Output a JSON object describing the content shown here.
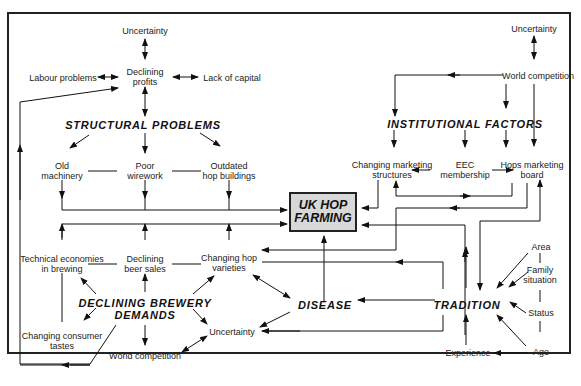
{
  "center": {
    "line1": "UK HOP",
    "line2": "FARMING"
  },
  "groups": {
    "structural": "STRUCTURAL PROBLEMS",
    "institutional": "INSTITUTIONAL FACTORS",
    "brewery_l1": "DECLINING BREWERY",
    "brewery_l2": "DEMANDS",
    "disease": "DISEASE",
    "tradition": "TRADITION"
  },
  "nodes": {
    "uncertainty_top_left": "Uncertainty",
    "declining_profits_l1": "Declining",
    "declining_profits_l2": "profits",
    "labour_problems": "Labour problems",
    "lack_of_capital": "Lack of capital",
    "old_machinery_l1": "Old",
    "old_machinery_l2": "machinery",
    "poor_wirework_l1": "Poor",
    "poor_wirework_l2": "wirework",
    "outdated_l1": "Outdated",
    "outdated_l2": "hop buildings",
    "uncertainty_top_right": "Uncertainty",
    "world_competition_top": "World competition",
    "changing_marketing_l1": "Changing marketing",
    "changing_marketing_l2": "structures",
    "eec_l1": "EEC",
    "eec_l2": "membership",
    "hops_board_l1": "Hops marketing",
    "hops_board_l2": "board",
    "technical_l1": "Technical economies",
    "technical_l2": "in brewing",
    "beer_sales_l1": "Declining",
    "beer_sales_l2": "beer sales",
    "hop_varieties_l1": "Changing hop",
    "hop_varieties_l2": "varieties",
    "consumer_l1": "Changing consumer",
    "consumer_l2": "tastes",
    "uncertainty_bottom": "Uncertainty",
    "world_competition_bottom": "World competition",
    "area": "Area",
    "family_l1": "Family",
    "family_l2": "situation",
    "status": "Status",
    "age": "Age",
    "experience": "Experience"
  },
  "caption": "Figure: Factors influencing UK hop farming"
}
